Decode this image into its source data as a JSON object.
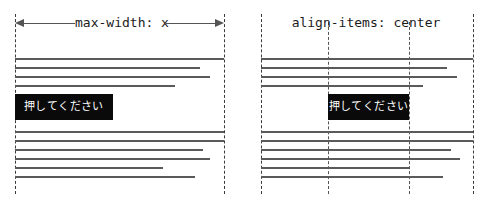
{
  "canvas": {
    "width": 488,
    "height": 207,
    "background": "#ffffff",
    "line_color": "#5a5a5a",
    "guide_color": "#3b3b3b",
    "button_bg": "#0a0a0a",
    "button_fg": "#ffffff"
  },
  "panels": [
    {
      "id": "left",
      "caption": "max-width: x",
      "has_arrow": true,
      "arrow": {
        "left_glyph": "←",
        "right_glyph": "→",
        "label": "max-width: x"
      },
      "button": {
        "label": "押してください",
        "align": "left"
      },
      "guides": [
        {
          "x": 15,
          "style": "dashed"
        },
        {
          "x": 224,
          "style": "dashed"
        }
      ],
      "content_left": 15,
      "content_right": 224,
      "lines_top_group": [
        {
          "y": 58,
          "x": 15,
          "width": 209
        },
        {
          "y": 67,
          "x": 15,
          "width": 185
        },
        {
          "y": 76,
          "x": 15,
          "width": 195
        },
        {
          "y": 85,
          "x": 15,
          "width": 160
        }
      ],
      "lines_bottom_group": [
        {
          "y": 131,
          "x": 15,
          "width": 209
        },
        {
          "y": 140,
          "x": 15,
          "width": 209
        },
        {
          "y": 149,
          "x": 15,
          "width": 188
        },
        {
          "y": 158,
          "x": 15,
          "width": 195
        },
        {
          "y": 167,
          "x": 15,
          "width": 148
        },
        {
          "y": 176,
          "x": 15,
          "width": 180
        }
      ]
    },
    {
      "id": "right",
      "caption": "align-items: center",
      "has_arrow": false,
      "button": {
        "label": "押してください",
        "align": "center"
      },
      "guides": [
        {
          "x": 17,
          "style": "dashed"
        },
        {
          "x": 84,
          "style": "dashed"
        },
        {
          "x": 165,
          "style": "dashed"
        },
        {
          "x": 229,
          "style": "dashed"
        }
      ],
      "content_left": 17,
      "content_right": 229,
      "lines_top_group": [
        {
          "y": 58,
          "x": 17,
          "width": 212
        },
        {
          "y": 67,
          "x": 17,
          "width": 186
        },
        {
          "y": 76,
          "x": 17,
          "width": 196
        },
        {
          "y": 85,
          "x": 17,
          "width": 162
        }
      ],
      "lines_bottom_group": [
        {
          "y": 131,
          "x": 17,
          "width": 212
        },
        {
          "y": 140,
          "x": 17,
          "width": 212
        },
        {
          "y": 149,
          "x": 17,
          "width": 190
        },
        {
          "y": 158,
          "x": 17,
          "width": 199
        },
        {
          "y": 167,
          "x": 17,
          "width": 149
        },
        {
          "y": 176,
          "x": 17,
          "width": 182
        }
      ]
    }
  ]
}
